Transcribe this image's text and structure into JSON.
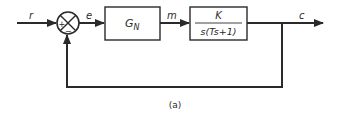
{
  "diagram": {
    "type": "block-diagram",
    "input_signal": "r",
    "error_signal": "e",
    "controller": {
      "label": "G",
      "subscript": "N"
    },
    "control_signal": "m",
    "plant": {
      "numerator": "K",
      "denominator": "s(Ts+1)"
    },
    "output_signal": "c",
    "summing_junction": {
      "plus_sign": "+",
      "minus_sign": "−"
    },
    "caption": "(a)"
  },
  "colors": {
    "stroke": "#2a2a2a",
    "background": "#ffffff"
  }
}
